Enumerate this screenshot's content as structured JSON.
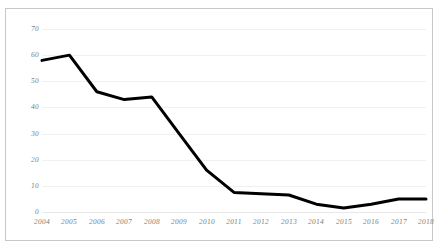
{
  "chart_data": {
    "type": "line",
    "title": "",
    "subtitle": "",
    "xlabel": "",
    "ylabel": "",
    "categories": [
      "2004",
      "2005",
      "2006",
      "2007",
      "2008",
      "2009",
      "2010",
      "2011",
      "2012",
      "2013",
      "2014",
      "2015",
      "2016",
      "2017",
      "2018"
    ],
    "series": [
      {
        "name": "series-1",
        "values": [
          58,
          60,
          46,
          43,
          44,
          30,
          16,
          7.5,
          7,
          6.5,
          3,
          1.5,
          3,
          5,
          5
        ]
      }
    ],
    "ylim": [
      0,
      70
    ],
    "yticks": [
      0,
      10,
      20,
      30,
      40,
      50,
      60,
      70
    ],
    "ytick_labels": [
      "0",
      "10",
      "20",
      "30",
      "40",
      "50",
      "60",
      "70"
    ],
    "xtick_labels": [
      "2004",
      "2005",
      "2006",
      "2007",
      "2008",
      "2009",
      "2010",
      "2011",
      "2012",
      "2013",
      "2014",
      "2015",
      "2016",
      "2017",
      "2018"
    ],
    "grid": true,
    "grid_axis": "y",
    "legend": false,
    "legend_position": "none",
    "annotations": [],
    "colors": {
      "line": "#000000",
      "grid": "#f0f0f0",
      "axis_text": "#808080",
      "border": "#c8c8c8",
      "background": "#ffffff"
    },
    "line_width": 3
  }
}
